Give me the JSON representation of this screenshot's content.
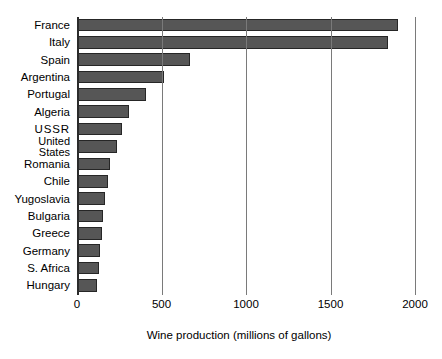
{
  "chart_data": {
    "type": "bar",
    "orientation": "horizontal",
    "title": "",
    "xlabel": "Wine production (millions of gallons)",
    "ylabel": "",
    "xlim": [
      0,
      2000
    ],
    "xticks": [
      0,
      500,
      1000,
      1500,
      2000
    ],
    "xtick_labels": [
      "0",
      "500",
      "1000",
      "1500",
      "2000"
    ],
    "grid": true,
    "grid_axis": "x",
    "legend": false,
    "bar_color": "#565656",
    "bar_edge_color": "#262626",
    "background": "#ffffff",
    "categories": [
      "France",
      "Italy",
      "Spain",
      "Argentina",
      "Portugal",
      "Algeria",
      "USSR",
      "United States",
      "Romania",
      "Chile",
      "Yugoslavia",
      "Bulgaria",
      "Greece",
      "Germany",
      "S. Africa",
      "Hungary"
    ],
    "values": [
      1900,
      1840,
      670,
      515,
      410,
      305,
      265,
      235,
      195,
      183,
      165,
      153,
      148,
      135,
      130,
      118
    ]
  },
  "axis": {
    "x_title": "Wine production (millions of gallons)",
    "ticks": [
      "0",
      "500",
      "1000",
      "1500",
      "2000"
    ]
  },
  "categories": {
    "labels": [
      "France",
      "Italy",
      "Spain",
      "Argentina",
      "Portugal",
      "Algeria",
      "USSR",
      "United States",
      "Romania",
      "Chile",
      "Yugoslavia",
      "Bulgaria",
      "Greece",
      "Germany",
      "S. Africa",
      "Hungary"
    ],
    "united_states_line1": "United",
    "united_states_line2": "States"
  }
}
